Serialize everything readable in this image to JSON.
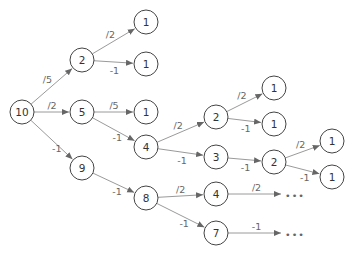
{
  "diagram": {
    "title": "",
    "nodes": [
      {
        "id": "n10",
        "label": "10",
        "x": 22,
        "y": 112
      },
      {
        "id": "n2a",
        "label": "2",
        "x": 82,
        "y": 60
      },
      {
        "id": "n5",
        "label": "5",
        "x": 82,
        "y": 112
      },
      {
        "id": "n9",
        "label": "9",
        "x": 82,
        "y": 168
      },
      {
        "id": "n1a",
        "label": "1",
        "x": 146,
        "y": 22
      },
      {
        "id": "n1b",
        "label": "1",
        "x": 146,
        "y": 64
      },
      {
        "id": "n1c",
        "label": "1",
        "x": 146,
        "y": 112
      },
      {
        "id": "n4a",
        "label": "4",
        "x": 146,
        "y": 147
      },
      {
        "id": "n8",
        "label": "8",
        "x": 146,
        "y": 198
      },
      {
        "id": "n2b",
        "label": "2",
        "x": 216,
        "y": 117
      },
      {
        "id": "n3",
        "label": "3",
        "x": 216,
        "y": 157
      },
      {
        "id": "n4b",
        "label": "4",
        "x": 216,
        "y": 194
      },
      {
        "id": "n7",
        "label": "7",
        "x": 216,
        "y": 233
      },
      {
        "id": "n1d",
        "label": "1",
        "x": 274,
        "y": 88
      },
      {
        "id": "n1e",
        "label": "1",
        "x": 274,
        "y": 124
      },
      {
        "id": "n2c",
        "label": "2",
        "x": 274,
        "y": 162
      },
      {
        "id": "n1f",
        "label": "1",
        "x": 332,
        "y": 141
      },
      {
        "id": "n1g",
        "label": "1",
        "x": 332,
        "y": 177
      }
    ],
    "edges": [
      {
        "from": "n10",
        "to": "n2a",
        "label": "/5"
      },
      {
        "from": "n10",
        "to": "n5",
        "label": "/2"
      },
      {
        "from": "n10",
        "to": "n9",
        "label": "-1"
      },
      {
        "from": "n2a",
        "to": "n1a",
        "label": "/2"
      },
      {
        "from": "n2a",
        "to": "n1b",
        "label": "-1"
      },
      {
        "from": "n5",
        "to": "n1c",
        "label": "/5"
      },
      {
        "from": "n5",
        "to": "n4a",
        "label": "-1"
      },
      {
        "from": "n9",
        "to": "n8",
        "label": "-1"
      },
      {
        "from": "n4a",
        "to": "n2b",
        "label": "/2"
      },
      {
        "from": "n4a",
        "to": "n3",
        "label": "-1"
      },
      {
        "from": "n8",
        "to": "n4b",
        "label": "/2"
      },
      {
        "from": "n8",
        "to": "n7",
        "label": "-1"
      },
      {
        "from": "n2b",
        "to": "n1d",
        "label": "/2"
      },
      {
        "from": "n2b",
        "to": "n1e",
        "label": "-1"
      },
      {
        "from": "n3",
        "to": "n2c",
        "label": "-1"
      },
      {
        "from": "n2c",
        "to": "n1f",
        "label": "/2"
      },
      {
        "from": "n2c",
        "to": "n1g",
        "label": "-1"
      }
    ],
    "continuations": [
      {
        "from": "n4b",
        "label": "/2",
        "ellipsis": "•••",
        "x": 285,
        "y": 194
      },
      {
        "from": "n7",
        "label": "-1",
        "ellipsis": "•••",
        "x": 285,
        "y": 233
      }
    ]
  }
}
